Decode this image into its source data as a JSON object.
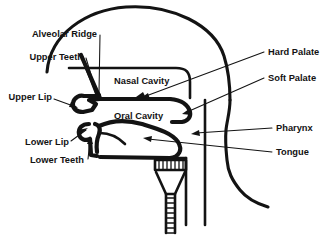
{
  "diagram": {
    "background_color": "#ffffff",
    "ink_color": "#131313"
  },
  "labels": {
    "left": [
      {
        "id": "alveolar-ridge",
        "text": "Alveolar Ridge",
        "x": 97,
        "y": 37
      },
      {
        "id": "upper-teeth",
        "text": "Upper Teeth",
        "x": 83,
        "y": 60
      },
      {
        "id": "upper-lip",
        "text": "Upper Lip",
        "x": 70,
        "y": 100
      },
      {
        "id": "lower-lip",
        "text": "Lower Lip",
        "x": 70,
        "y": 145
      },
      {
        "id": "lower-teeth",
        "text": "Lower Teeth",
        "x": 84,
        "y": 163
      }
    ],
    "right": [
      {
        "id": "hard-palate",
        "text": "Hard Palate",
        "x": 268,
        "y": 55
      },
      {
        "id": "soft-palate",
        "text": "Soft Palate",
        "x": 268,
        "y": 81
      },
      {
        "id": "pharynx",
        "text": "Pharynx",
        "x": 276,
        "y": 131
      },
      {
        "id": "tongue",
        "text": "Tongue",
        "x": 276,
        "y": 155
      }
    ],
    "interior": [
      {
        "id": "nasal-cavity",
        "text": "Nasal Cavity",
        "x": 114,
        "y": 82
      },
      {
        "id": "oral-cavity",
        "text": "Oral Cavity",
        "x": 114,
        "y": 117
      }
    ]
  },
  "structures": [
    {
      "id": "skull-outline",
      "name": "skull-outline"
    },
    {
      "id": "neck-outline",
      "name": "neck-outline"
    },
    {
      "id": "nasal-cavity-wall",
      "name": "nasal-cavity-wall"
    },
    {
      "id": "hard-palate-line",
      "name": "hard-palate-line"
    },
    {
      "id": "soft-palate-arc",
      "name": "soft-palate-arc"
    },
    {
      "id": "upper-lip-teeth",
      "name": "upper-lip-and-teeth"
    },
    {
      "id": "lower-lip-teeth",
      "name": "lower-lip-and-teeth"
    },
    {
      "id": "tongue-body",
      "name": "tongue-body"
    },
    {
      "id": "pharynx-wall",
      "name": "pharynx-wall"
    },
    {
      "id": "larynx-box",
      "name": "larynx-box"
    },
    {
      "id": "larynx-cone",
      "name": "larynx-cone"
    },
    {
      "id": "trachea-tube",
      "name": "trachea-tube"
    }
  ]
}
